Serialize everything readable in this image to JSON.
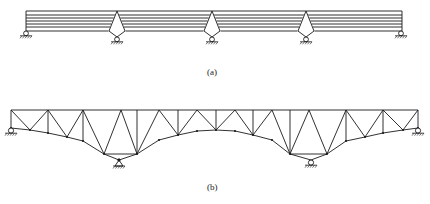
{
  "figure": {
    "a": {
      "label": "(a)",
      "description": "Continuous multi-layer deck beam over three intermediate diamond-shaped (rhombic) pier supports with roller end supports",
      "deck": {
        "x_left": 26,
        "x_right": 402,
        "y_top": 11,
        "layers_y": [
          11,
          15,
          18,
          21,
          24,
          27,
          31
        ]
      },
      "end_supports": [
        {
          "type": "roller",
          "x": 26,
          "y": 31
        },
        {
          "type": "roller",
          "x": 401,
          "y": 31
        }
      ],
      "piers": [
        {
          "x": 117,
          "top_y": 11,
          "mid_y": 31,
          "bottom_y": 38,
          "half_width": 8,
          "support": "roller"
        },
        {
          "x": 212,
          "top_y": 11,
          "mid_y": 31,
          "bottom_y": 38,
          "half_width": 8,
          "support": "roller"
        },
        {
          "x": 306,
          "top_y": 11,
          "mid_y": 31,
          "bottom_y": 38,
          "half_width": 8,
          "support": "roller"
        }
      ]
    },
    "b": {
      "label": "(b)",
      "description": "Continuous haunched truss bridge, curved bottom chord over two inclined-leg intermediate supports",
      "top_chord_y": 110,
      "top_nodes_x": [
        11,
        30,
        48,
        67,
        83,
        104,
        121,
        137,
        159,
        178,
        197,
        216,
        235,
        253,
        272,
        290,
        309,
        327,
        346,
        365,
        383,
        403,
        418
      ],
      "supports": [
        {
          "type": "roller",
          "x": 11,
          "y": 128
        },
        {
          "type": "pin",
          "x": 119,
          "y": 160
        },
        {
          "type": "roller",
          "x": 311,
          "y": 160
        },
        {
          "type": "roller",
          "x": 418,
          "y": 128
        }
      ]
    }
  },
  "colors": {
    "line": "#1a1a1a",
    "background": "#ffffff"
  }
}
